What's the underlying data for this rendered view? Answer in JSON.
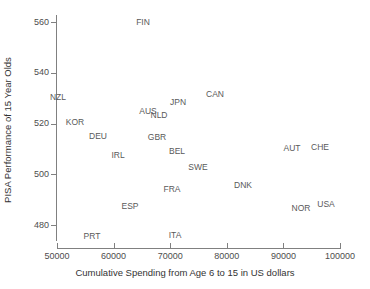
{
  "chart_data": {
    "type": "scatter",
    "title": "",
    "xlabel": "Cumulative Spending from Age 6 to 15 in US dollars",
    "ylabel": "PISA Performance of 15 Year Olds",
    "xlim": [
      50000,
      100000
    ],
    "ylim": [
      473,
      565
    ],
    "xticks": [
      50000,
      60000,
      70000,
      80000,
      90000,
      100000
    ],
    "xtick_labels": [
      "50000",
      "60000",
      "70000",
      "80000",
      "90000",
      "100000"
    ],
    "yticks": [
      480,
      500,
      520,
      540,
      560
    ],
    "ytick_labels": [
      "480",
      "500",
      "520",
      "540",
      "560"
    ],
    "grid": false,
    "legend": false,
    "marker_style": "text-label-only",
    "points": [
      {
        "label": "FIN",
        "x": 65200,
        "y": 562,
        "px": 143,
        "py": 22
      },
      {
        "label": "CAN",
        "x": 77900,
        "y": 534,
        "px": 215,
        "py": 94
      },
      {
        "label": "JPN",
        "x": 71400,
        "y": 531,
        "px": 178,
        "py": 102
      },
      {
        "label": "NZL",
        "x": 50200,
        "y": 529,
        "px": 58,
        "py": 97
      },
      {
        "label": "AUS",
        "x": 66100,
        "y": 526,
        "px": 148,
        "py": 111
      },
      {
        "label": "NLD",
        "x": 68000,
        "y": 525,
        "px": 159,
        "py": 115
      },
      {
        "label": "KOR",
        "x": 53200,
        "y": 522,
        "px": 75,
        "py": 122
      },
      {
        "label": "DEU",
        "x": 57300,
        "y": 517,
        "px": 98,
        "py": 136
      },
      {
        "label": "GBR",
        "x": 67700,
        "y": 516,
        "px": 157,
        "py": 137
      },
      {
        "label": "CHE",
        "x": 95400,
        "y": 512,
        "px": 320,
        "py": 147
      },
      {
        "label": "AUT",
        "x": 90500,
        "y": 512,
        "px": 292,
        "py": 148
      },
      {
        "label": "BEL",
        "x": 71200,
        "y": 511,
        "px": 177,
        "py": 151
      },
      {
        "label": "IRL",
        "x": 60800,
        "y": 508,
        "px": 118,
        "py": 155
      },
      {
        "label": "SWE",
        "x": 74900,
        "y": 505,
        "px": 198,
        "py": 167
      },
      {
        "label": "DNK",
        "x": 82900,
        "y": 496,
        "px": 243,
        "py": 185
      },
      {
        "label": "FRA",
        "x": 70400,
        "y": 495,
        "px": 172,
        "py": 189
      },
      {
        "label": "USA",
        "x": 96400,
        "y": 489,
        "px": 326,
        "py": 204
      },
      {
        "label": "NOR",
        "x": 92000,
        "y": 488,
        "px": 301,
        "py": 208
      },
      {
        "label": "ESP",
        "x": 62900,
        "y": 488,
        "px": 130,
        "py": 206
      },
      {
        "label": "ITA",
        "x": 70800,
        "y": 476,
        "px": 175,
        "py": 235
      },
      {
        "label": "PRT",
        "x": 56200,
        "y": 476,
        "px": 92,
        "py": 236
      }
    ]
  },
  "colors": {
    "axis": "#808080",
    "tick_text": "#4d4d4d",
    "axis_title": "#333333",
    "point_label": "#595959",
    "background": "#ffffff"
  }
}
